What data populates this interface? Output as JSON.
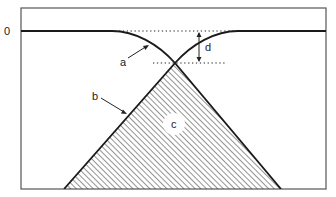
{
  "diagram": {
    "y_axis_label": "0",
    "labels": {
      "a": "a",
      "b": "b",
      "c": "c",
      "d": "d"
    },
    "colors": {
      "line": "#1a1a1a",
      "frame": "#555555",
      "hatch": "#3a3a3a",
      "background": "#ffffff"
    }
  }
}
